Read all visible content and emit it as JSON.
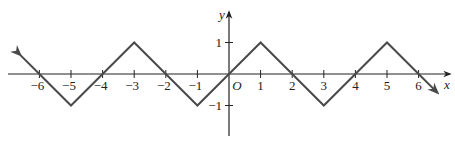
{
  "chart_data": {
    "type": "line",
    "title": "",
    "xlabel": "x",
    "ylabel": "y",
    "origin_label": "O",
    "x_ticks": [
      -6,
      -5,
      -4,
      -3,
      -2,
      -1,
      1,
      2,
      3,
      4,
      5,
      6
    ],
    "x_tick_labels": [
      "−6",
      "−5",
      "−4",
      "−3",
      "−2",
      "−1",
      "1",
      "2",
      "3",
      "4",
      "5",
      "6"
    ],
    "y_ticks": [
      1,
      -1
    ],
    "y_tick_labels": [
      "1",
      "−1"
    ],
    "xlim": [
      -7.1,
      7.3
    ],
    "ylim": [
      -1.7,
      2.2
    ],
    "grid": false,
    "series": [
      {
        "name": "periodic triangle wave",
        "x": [
          -6.6,
          -6,
          -5,
          -4,
          -3,
          -2,
          -1,
          0,
          1,
          2,
          3,
          4,
          5,
          6,
          6.6
        ],
        "y": [
          0.6,
          0,
          -1,
          0,
          1,
          0,
          -1,
          0,
          1,
          0,
          -1,
          0,
          1,
          0,
          -0.6
        ],
        "arrows_at_ends": true
      }
    ],
    "colors": {
      "curve": "#4a4a4a",
      "axis": "#222222"
    }
  }
}
